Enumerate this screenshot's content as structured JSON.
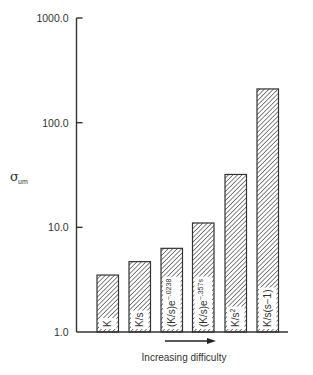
{
  "chart_data": {
    "type": "bar",
    "title": "",
    "xlabel": "Increasing difficulty",
    "ylabel": "σ_um",
    "ylabel_main": "σ",
    "ylabel_sub": "um",
    "yscale": "log",
    "ylim": [
      1.0,
      1000.0
    ],
    "yticks": [
      {
        "value": 1.0,
        "label": "1.0"
      },
      {
        "value": 10.0,
        "label": "10.0"
      },
      {
        "value": 100.0,
        "label": "100.0"
      },
      {
        "value": 1000.0,
        "label": "1000.0"
      }
    ],
    "grid": false,
    "legend": null,
    "bar_fill": "diagonal-hatch",
    "categories": [
      {
        "base": "K",
        "sup": ""
      },
      {
        "base": "K/s",
        "sup": ""
      },
      {
        "base": "(K/s)e",
        "sup": "−.0238"
      },
      {
        "base": "(K/s)e",
        "sup": "−.357s"
      },
      {
        "base": "K/s",
        "sup": "2"
      },
      {
        "base": "K/s(s−1)",
        "sup": ""
      }
    ],
    "category_labels": [
      "K",
      "K/s",
      "(K/s)e^−.0238",
      "(K/s)e^−.357s",
      "K/s^2",
      "K/s(s−1)"
    ],
    "values": [
      3.5,
      4.7,
      6.3,
      11.0,
      32.0,
      210.0
    ],
    "annotations": [
      {
        "type": "arrow",
        "direction": "right",
        "text": "Increasing difficulty",
        "position": "below-x-axis"
      }
    ]
  }
}
